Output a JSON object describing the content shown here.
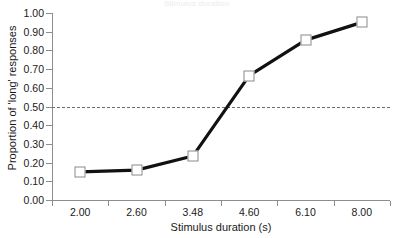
{
  "chart_data": {
    "type": "line",
    "title": "Stimulus duration",
    "xlabel": "Stimulus duration (s)",
    "ylabel": "Proportion of 'long' responses",
    "categories": [
      "2.00",
      "2.60",
      "3.48",
      "4.60",
      "6.10",
      "8.00"
    ],
    "x_values": [
      2.0,
      2.6,
      3.48,
      4.6,
      6.1,
      8.0
    ],
    "values": [
      0.15,
      0.16,
      0.235,
      0.665,
      0.855,
      0.95
    ],
    "ylim": [
      0.0,
      1.0
    ],
    "ytick_labels": [
      "0.00",
      "0.10",
      "0.20",
      "0.30",
      "0.40",
      "0.50",
      "0.60",
      "0.70",
      "0.80",
      "0.90",
      "1.00"
    ],
    "ytick_values": [
      0.0,
      0.1,
      0.2,
      0.3,
      0.4,
      0.5,
      0.6,
      0.7,
      0.8,
      0.9,
      1.0
    ],
    "grid": false,
    "legend": "none",
    "annotations": [
      {
        "name": "chance-level-reference-line",
        "type": "horizontal-dashed-line",
        "y": 0.5,
        "color": "#6e6e6e"
      }
    ],
    "series": [
      {
        "name": "proportion-long-responses",
        "marker": "open-square",
        "marker_color": "#ffffff",
        "marker_edge_color": "#8a8a8a",
        "line_color": "#111111",
        "values": [
          0.15,
          0.16,
          0.235,
          0.665,
          0.855,
          0.95
        ]
      }
    ],
    "colors": {
      "line": "#111111",
      "marker_face": "#ffffff",
      "marker_edge": "#8a8a8a",
      "axis": "#8d8d8d",
      "reference_line": "#6e6e6e",
      "text": "#1a1a1a",
      "background": "#ffffff"
    }
  }
}
